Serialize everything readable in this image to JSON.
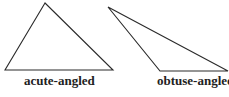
{
  "figures": [
    {
      "id": "acute",
      "label": "acute-angled",
      "points": "45,3 5,70 113,70"
    },
    {
      "id": "obtuse",
      "label": "obtuse-angled",
      "points": "108,7 160,71 228,71"
    }
  ],
  "colors": {
    "stroke": "#2a2a2a",
    "text": "#222222",
    "background": "#ffffff"
  }
}
